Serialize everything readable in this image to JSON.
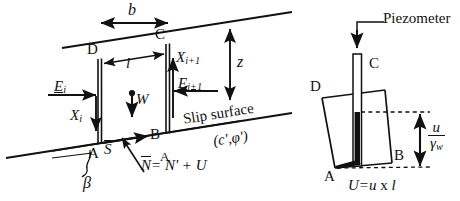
{
  "figure": {
    "background_color": "#ffffff",
    "line_color": "#111111"
  },
  "left_diagram": {
    "name": "slice-force-diagram",
    "vertices": {
      "a": "A",
      "b": "B",
      "c": "C",
      "d": "D"
    },
    "dimensions": {
      "width_b": "b",
      "depth_z": "z",
      "base_length_l": "l"
    },
    "forces": {
      "weight": "W",
      "interslice_normal_left": "E",
      "interslice_normal_left_sub": "i",
      "interslice_normal_right": "E",
      "interslice_normal_right_sub": "i+1",
      "interslice_shear_left": "X",
      "interslice_shear_left_sub": "i",
      "interslice_shear_right": "X",
      "interslice_shear_right_sub": "i+1",
      "shear_force": "S",
      "normal_force_equation_lead": "N",
      "normal_force_equation_rest": "= N' + U"
    },
    "slip_surface_label": "Slip surface",
    "strength_params": "(c',φ')",
    "slope_angle": "β"
  },
  "right_diagram": {
    "name": "piezometer-diagram",
    "vertices": {
      "a": "A",
      "b": "B",
      "c": "C",
      "d": "D"
    },
    "piezometer_label": "Piezometer",
    "pressure_head": {
      "numerator": "u",
      "denominator": "γ",
      "denominator_sub": "w"
    },
    "resultant_equation": {
      "lhs": "U",
      "rhs_prefix": "=",
      "rhs_u": "u",
      "rhs_times": " x ",
      "rhs_l": "l"
    }
  }
}
